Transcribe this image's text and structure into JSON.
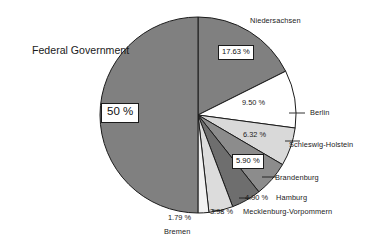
{
  "chart_data": {
    "type": "pie",
    "title": "",
    "legend_position": "callout-labels",
    "grid": false,
    "total": 100.02,
    "unit": "%",
    "categories": [
      "Federal Government",
      "Niedersachsen",
      "Berlin",
      "Schleswig-Holstein",
      "Brandenburg",
      "Hamburg",
      "Mecklenburg-Vorpommern",
      "Bremen"
    ],
    "values": [
      50,
      17.63,
      9.5,
      6.32,
      5.9,
      4.9,
      3.98,
      1.79
    ],
    "value_labels": [
      "50 %",
      "17.63 %",
      "9.50 %",
      "6.32 %",
      "5.90 %",
      "4.90 %",
      "3.98 %",
      "1.79 %"
    ],
    "slice_colors": [
      "#808080",
      "#808080",
      "#ffffff",
      "#d9d9d9",
      "#8c8c8c",
      "#6e6e6e",
      "#dcdcdc",
      "#f2f2f2"
    ],
    "slices": [
      {
        "name": "Niedersachsen",
        "value": 17.63,
        "label": "17.63 %",
        "color": "#808080"
      },
      {
        "name": "Berlin",
        "value": 9.5,
        "label": "9.50 %",
        "color": "#ffffff"
      },
      {
        "name": "Schleswig-Holstein",
        "value": 6.32,
        "label": "6.32 %",
        "color": "#d9d9d9"
      },
      {
        "name": "Brandenburg",
        "value": 5.9,
        "label": "5.90 %",
        "color": "#8c8c8c"
      },
      {
        "name": "Hamburg",
        "value": 4.9,
        "label": "4.90 %",
        "color": "#6e6e6e"
      },
      {
        "name": "Mecklenburg-Vorpommern",
        "value": 3.98,
        "label": "3.98 %",
        "color": "#dcdcdc"
      },
      {
        "name": "Bremen",
        "value": 1.79,
        "label": "1.79 %",
        "color": "#f2f2f2"
      },
      {
        "name": "Federal Government",
        "value": 50.0,
        "label": "50 %",
        "color": "#808080"
      }
    ]
  },
  "labels": {
    "federal_government": "Federal Government",
    "niedersachsen": "Niedersachsen",
    "berlin": "Berlin",
    "schleswig_holstein": "Schleswig-Holstein",
    "brandenburg": "Brandenburg",
    "hamburg": "Hamburg",
    "mecklenburg": "Mecklenburg-Vorpommern",
    "bremen": "Bremen"
  },
  "values": {
    "federal_government": "50 %",
    "niedersachsen": "17.63 %",
    "berlin": "9.50 %",
    "schleswig_holstein": "6.32 %",
    "brandenburg": "5.90 %",
    "hamburg": "4.90 %",
    "mecklenburg": "3.98 %",
    "bremen": "1.79 %"
  },
  "style": {
    "background": "#ffffff",
    "outline": "#1b1b1b",
    "text": "#1a1a1a"
  }
}
